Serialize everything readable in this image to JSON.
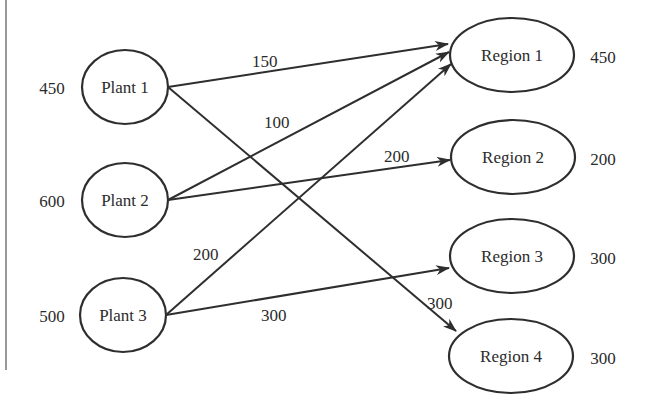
{
  "diagram": {
    "type": "transportation-network",
    "plants": [
      {
        "id": "P1",
        "label": "Plant 1",
        "supply": "450",
        "cx": 125,
        "cy": 87
      },
      {
        "id": "P2",
        "label": "Plant 2",
        "supply": "600",
        "cx": 125,
        "cy": 200
      },
      {
        "id": "P3",
        "label": "Plant 3",
        "supply": "500",
        "cx": 123,
        "cy": 315
      }
    ],
    "regions": [
      {
        "id": "R1",
        "label": "Region 1",
        "demand": "450",
        "cx": 512,
        "cy": 55
      },
      {
        "id": "R2",
        "label": "Region 2",
        "demand": "200",
        "cx": 513,
        "cy": 157
      },
      {
        "id": "R3",
        "label": "Region 3",
        "demand": "300",
        "cx": 512,
        "cy": 256
      },
      {
        "id": "R4",
        "label": "Region 4",
        "demand": "300",
        "cx": 511,
        "cy": 356
      }
    ],
    "edges": [
      {
        "from": "Plant 1",
        "to": "Region 1",
        "flow": "150",
        "x1": 168,
        "y1": 87,
        "x2": 448,
        "y2": 44,
        "lx": 252,
        "ly": 67
      },
      {
        "from": "Plant 1",
        "to": "Region 4",
        "flow": "300",
        "x1": 168,
        "y1": 87,
        "x2": 456,
        "y2": 331,
        "lx": 427,
        "ly": 309
      },
      {
        "from": "Plant 2",
        "to": "Region 1",
        "flow": "100",
        "x1": 168,
        "y1": 200,
        "x2": 449,
        "y2": 52,
        "lx": 264,
        "ly": 128
      },
      {
        "from": "Plant 2",
        "to": "Region 2",
        "flow": "200",
        "x1": 168,
        "y1": 200,
        "x2": 450,
        "y2": 160,
        "lx": 384,
        "ly": 162
      },
      {
        "from": "Plant 3",
        "to": "Region 1",
        "flow": "200",
        "x1": 166,
        "y1": 315,
        "x2": 451,
        "y2": 64,
        "lx": 193,
        "ly": 260
      },
      {
        "from": "Plant 3",
        "to": "Region 3",
        "flow": "300",
        "x1": 166,
        "y1": 315,
        "x2": 449,
        "y2": 268,
        "lx": 261,
        "ly": 321
      }
    ]
  }
}
